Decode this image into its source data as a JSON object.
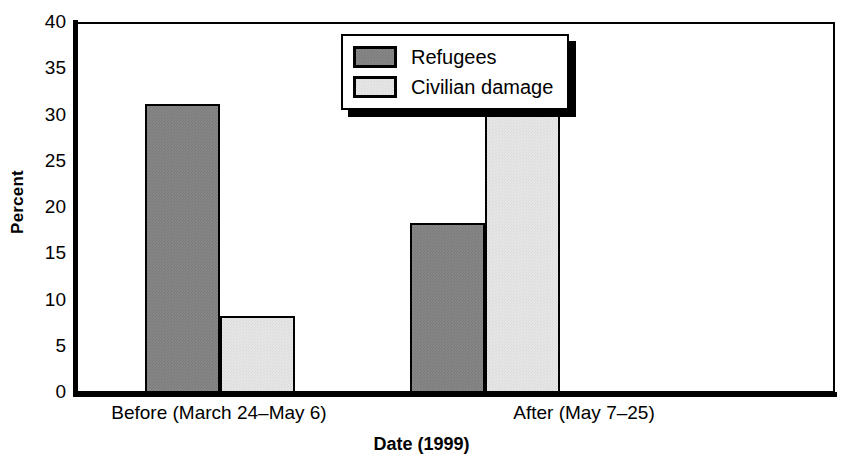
{
  "chart_data": {
    "type": "bar",
    "title": "",
    "xlabel": "Date (1999)",
    "ylabel": "Percent",
    "categories": [
      "Before (March 24–May 6)",
      "After (May 7–25)"
    ],
    "series": [
      {
        "name": "Refugees",
        "values": [
          31.2,
          18.4
        ],
        "color": "#888888"
      },
      {
        "name": "Civilian damage",
        "values": [
          8.3,
          37.5
        ],
        "color": "#e8e8e8"
      }
    ],
    "ylim": [
      0,
      40
    ],
    "yticks": [
      0,
      5,
      10,
      15,
      20,
      25,
      30,
      35,
      40
    ],
    "ytick_labels": [
      "0",
      "5",
      "10",
      "15",
      "20",
      "25",
      "30",
      "35",
      "40"
    ],
    "grid": false,
    "legend_position": "upper center",
    "frame_color": "#000000",
    "background_color": "#ffffff"
  },
  "axes": {
    "y_title": "Percent",
    "x_title": "Date (1999)"
  },
  "legend": {
    "entries": [
      {
        "label": "Refugees",
        "swatch": "dark-gray-swatch"
      },
      {
        "label": "Civilian damage",
        "swatch": "light-gray-swatch"
      }
    ]
  },
  "ticks": {
    "y": [
      {
        "label": "40",
        "value": 40
      },
      {
        "label": "35",
        "value": 35
      },
      {
        "label": "30",
        "value": 30
      },
      {
        "label": "25",
        "value": 25
      },
      {
        "label": "20",
        "value": 20
      },
      {
        "label": "15",
        "value": 15
      },
      {
        "label": "10",
        "value": 10
      },
      {
        "label": "5",
        "value": 5
      },
      {
        "label": "0",
        "value": 0
      }
    ],
    "x": [
      {
        "label": "Before (March 24–May 6)"
      },
      {
        "label": "After (May 7–25)"
      }
    ]
  },
  "bars": [
    {
      "group": 0,
      "series": "Refugees",
      "value": 31.2,
      "style": "dark"
    },
    {
      "group": 0,
      "series": "Civilian damage",
      "value": 8.3,
      "style": "light"
    },
    {
      "group": 1,
      "series": "Refugees",
      "value": 18.4,
      "style": "dark"
    },
    {
      "group": 1,
      "series": "Civilian damage",
      "value": 37.5,
      "style": "light"
    }
  ]
}
